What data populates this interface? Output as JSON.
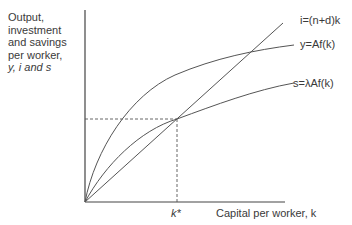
{
  "diagram": {
    "type": "solow-growth-model",
    "y_axis_label": {
      "lines": [
        "Output,",
        "investment",
        "and savings",
        "per worker,"
      ],
      "vars_line": "y, i and s"
    },
    "x_axis_label": "Capital per worker, k",
    "steady_state_label": "k*",
    "curves": [
      {
        "name": "investment-line",
        "label": "i=(n+d)k",
        "kind": "line"
      },
      {
        "name": "output-curve",
        "label": "y=Af(k)",
        "kind": "concave"
      },
      {
        "name": "savings-curve",
        "label": "s=λAf(k)",
        "kind": "concave"
      }
    ],
    "colors": {
      "axis": "#444444",
      "curve": "#555555",
      "text": "#3a3a3a"
    }
  }
}
